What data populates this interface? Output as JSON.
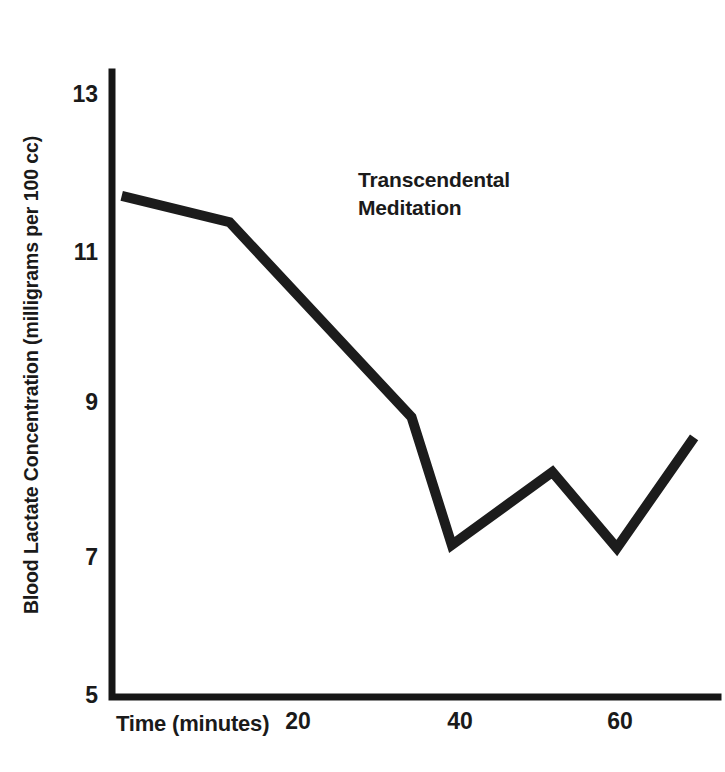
{
  "chart_data": {
    "type": "line",
    "title": "",
    "xlabel": "Time (minutes)",
    "ylabel": "Blood Lactate Concentration (milligrams per 100 cc)",
    "annotations": [
      {
        "name": "series-label",
        "text": "Transcendental\nMeditation",
        "x": 34,
        "y": 10.3
      }
    ],
    "xlim": [
      -3,
      70
    ],
    "ylim": [
      5,
      13.35
    ],
    "xticks": [
      20,
      40,
      60
    ],
    "xtick_labels": [
      "20",
      "40",
      "60"
    ],
    "yticks": [
      13,
      11,
      9,
      7,
      5
    ],
    "ytick_labels": [
      "13",
      "11",
      "9",
      "7",
      "5"
    ],
    "grid": false,
    "legend": false,
    "series": [
      {
        "name": "Transcendental Meditation",
        "color": "#1c1c1c",
        "x": [
          -1.9,
          11.5,
          34.1,
          39.1,
          51.6,
          59.6,
          69.2
        ],
        "values": [
          11.66,
          11.31,
          8.72,
          7.02,
          7.99,
          6.98,
          8.45
        ]
      }
    ]
  },
  "axis": {
    "y_title": "Blood Lactate Concentration (milligrams per 100 cc)",
    "x_title": "Time (minutes)",
    "ytick_0": "13",
    "ytick_1": "11",
    "ytick_2": "9",
    "ytick_3": "7",
    "ytick_4": "5",
    "xtick_0": "20",
    "xtick_1": "40",
    "xtick_2": "60"
  },
  "annotation": {
    "series_label": "Transcendental\nMeditation"
  },
  "colors": {
    "ink": "#1c1c1c",
    "background": "#ffffff"
  }
}
